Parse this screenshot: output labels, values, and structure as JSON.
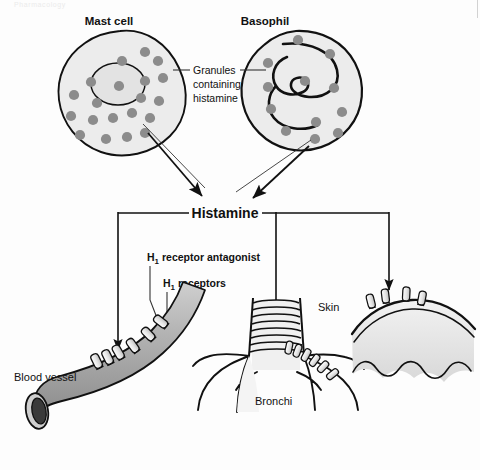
{
  "figure": {
    "type": "biomedical-diagram",
    "topic": "Histamine release from mast cells and basophils and H1 receptor sites",
    "page_header_faint": "Pharmacology",
    "background_color": "#fdfdfd",
    "line_color": "#111111",
    "granule_color": "#8c8c8c",
    "cell_fill": "#ececec",
    "vessel_fill": "#a8a8a8"
  },
  "labels": {
    "mast_cell": "Mast cell",
    "basophil": "Basophil",
    "granules_line1": "Granules",
    "granules_line2": "containing",
    "granules_line3": "histamine",
    "histamine": "Histamine",
    "h1_antagonist_sub": "1",
    "h1_antagonist_prefix": "H",
    "h1_antagonist_rest": " receptor antagonist",
    "h1_receptors_prefix": "H",
    "h1_receptors_sub": "1",
    "h1_receptors_rest": " receptors",
    "blood_vessel": "Blood vessel",
    "bronchi": "Bronchi",
    "skin": "Skin"
  },
  "nodes": [
    {
      "id": "mast-cell",
      "label": "Mast cell",
      "granule_count": 20
    },
    {
      "id": "basophil",
      "label": "Basophil",
      "granule_count": 11
    },
    {
      "id": "histamine",
      "label": "Histamine"
    },
    {
      "id": "blood-vessel",
      "label": "Blood vessel",
      "receptor_count": 6
    },
    {
      "id": "bronchi",
      "label": "Bronchi",
      "receptor_count": 6
    },
    {
      "id": "skin",
      "label": "Skin",
      "receptor_count": 4
    }
  ],
  "edges": [
    {
      "from": "mast-cell",
      "to": "histamine",
      "style": "arrow"
    },
    {
      "from": "basophil",
      "to": "histamine",
      "style": "arrow"
    },
    {
      "from": "histamine",
      "to": "blood-vessel",
      "style": "arrow"
    },
    {
      "from": "histamine",
      "to": "bronchi",
      "style": "arrow"
    },
    {
      "from": "histamine",
      "to": "skin",
      "style": "arrow"
    }
  ]
}
